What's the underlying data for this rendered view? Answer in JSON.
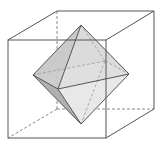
{
  "figure": {
    "title": "",
    "colors": {
      "background": "#ffffff",
      "edge": "#555555",
      "hidden_edge": "#8a8a8a",
      "face_light": "#e4e4e4",
      "face_mid": "#cfcfcf",
      "face_dark": "#b4b4b4"
    },
    "cube": {
      "vertices": {
        "front_top_left": [
          8,
          40
        ],
        "front_top_right": [
          106,
          40
        ],
        "front_bottom_right": [
          106,
          138
        ],
        "front_bottom_left": [
          8,
          138
        ],
        "back_top_left": [
          57,
          11
        ],
        "back_top_right": [
          154,
          11
        ],
        "back_bottom_right": [
          154,
          109
        ],
        "back_bottom_left": [
          57,
          109
        ]
      },
      "hidden_edges": [
        "back_top_left-back_bottom_left",
        "back_bottom_left-back_bottom_right",
        "back_bottom_left-front_bottom_left"
      ]
    },
    "octahedron": {
      "vertices": {
        "top": [
          81,
          25
        ],
        "bottom": [
          81,
          124
        ],
        "left": [
          33,
          75
        ],
        "right": [
          129,
          74
        ],
        "front": [
          58,
          89
        ],
        "back": [
          105,
          61
        ]
      }
    }
  }
}
